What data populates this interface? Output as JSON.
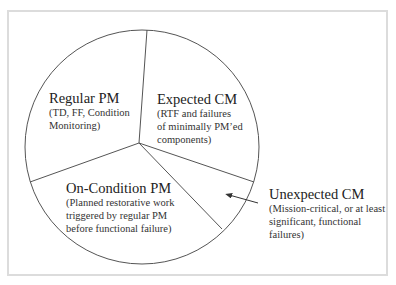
{
  "diagram": {
    "type": "pie-diagram",
    "segments": [
      {
        "id": "regular-pm",
        "title": "Regular PM",
        "description_lines": [
          "(TD, FF, Condition",
          "Monitoring)"
        ]
      },
      {
        "id": "expected-cm",
        "title": "Expected CM",
        "description_lines": [
          "(RTF and failures",
          "of minimally PM’ed",
          "components)"
        ]
      },
      {
        "id": "on-condition-pm",
        "title": "On-Condition PM",
        "description_lines": [
          "(Planned restorative work",
          "triggered by regular PM",
          "before functional failure)"
        ]
      },
      {
        "id": "unexpected-cm",
        "title": "Unexpected CM",
        "description_lines": [
          "(Mission-critical, or at least",
          "significant, functional",
          "failures)"
        ],
        "external_label": true,
        "arrow": {
          "from": [
            258,
            203
          ],
          "to": [
            229,
            195
          ]
        }
      }
    ],
    "colors": {
      "line": "#555555",
      "frame_border": "#dcdcdc",
      "background": "#ffffff"
    }
  }
}
